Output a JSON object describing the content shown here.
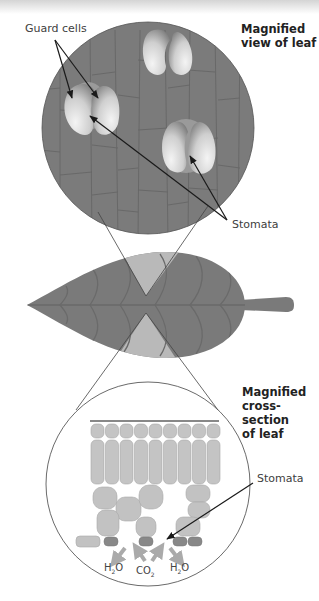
{
  "diagram": {
    "top_panel": {
      "title_line1": "Magnified",
      "title_line2": "view of leaf",
      "label_guard_cells": "Guard cells",
      "label_stomata": "Stomata"
    },
    "leaf": {
      "description": "Whole leaf with stem"
    },
    "bottom_panel": {
      "title_line1": "Magnified",
      "title_line2": "cross-section",
      "title_line3": "of leaf",
      "label_stomata": "Stomata",
      "gas_labels": {
        "h2o_left": "H",
        "h2o_left_sub": "2",
        "h2o_left_end": "O",
        "co2": "CO",
        "co2_sub": "2",
        "h2o_right": "H",
        "h2o_right_sub": "2",
        "h2o_right_end": "O"
      }
    },
    "colors": {
      "leaf_dark": "#7a7a7a",
      "leaf_light": "#b9b9b9",
      "cell_fill": "#c4c4c4",
      "guard_cell_light": "#f2f2f2",
      "guard_cell_dark": "#8a8a8a",
      "arrow": "#1a1a1a"
    }
  }
}
